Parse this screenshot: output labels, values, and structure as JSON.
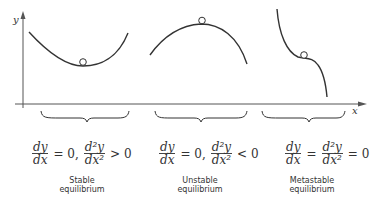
{
  "axes": {
    "y_label": "y",
    "x_label": "x"
  },
  "panels": [
    {
      "name": "stable",
      "condition": {
        "first": {
          "num": "dy",
          "den": "dx"
        },
        "rel1": "= 0,",
        "second": {
          "num": "d²y",
          "den": "dx²"
        },
        "rel2": "> 0"
      },
      "label_line1": "Stable",
      "label_line2": "equilibrium"
    },
    {
      "name": "unstable",
      "condition": {
        "first": {
          "num": "dy",
          "den": "dx"
        },
        "rel1": "= 0,",
        "second": {
          "num": "d²y",
          "den": "dx²"
        },
        "rel2": "< 0"
      },
      "label_line1": "Unstable",
      "label_line2": "equilibrium"
    },
    {
      "name": "metastable",
      "condition": {
        "first": {
          "num": "dy",
          "den": "dx"
        },
        "rel1": "=",
        "second": {
          "num": "d²y",
          "den": "dx²"
        },
        "rel2": "= 0"
      },
      "label_line1": "Metastable",
      "label_line2": "equilibrium"
    }
  ]
}
